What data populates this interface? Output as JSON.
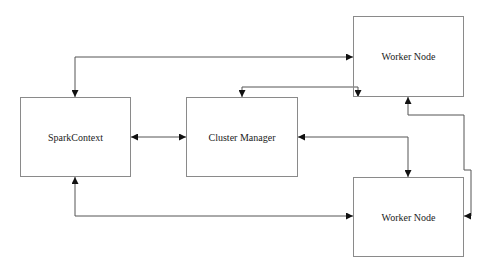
{
  "diagram": {
    "nodes": [
      {
        "id": "spark-context",
        "label": "SparkContext",
        "x": 20,
        "y": 97,
        "w": 111,
        "h": 80
      },
      {
        "id": "cluster-manager",
        "label": "Cluster Manager",
        "x": 186,
        "y": 97,
        "w": 112,
        "h": 80
      },
      {
        "id": "worker-node-top",
        "label": "Worker Node",
        "x": 353,
        "y": 16,
        "w": 111,
        "h": 81
      },
      {
        "id": "worker-node-bottom",
        "label": "Worker Node",
        "x": 353,
        "y": 177,
        "w": 111,
        "h": 80
      }
    ],
    "edges": [
      {
        "from": "spark-context",
        "to": "worker-node-top",
        "bidirectional": true
      },
      {
        "from": "cluster-manager",
        "to": "worker-node-top",
        "bidirectional": true
      },
      {
        "from": "spark-context",
        "to": "cluster-manager",
        "bidirectional": true
      },
      {
        "from": "cluster-manager",
        "to": "worker-node-bottom",
        "bidirectional": true
      },
      {
        "from": "worker-node-top",
        "to": "worker-node-bottom",
        "bidirectional": true
      },
      {
        "from": "spark-context",
        "to": "worker-node-bottom",
        "bidirectional": true
      }
    ],
    "colors": {
      "line": "#555555",
      "box_border": "#8a8a8a",
      "arrow": "#111111",
      "text": "#222222",
      "background": "#ffffff"
    }
  }
}
